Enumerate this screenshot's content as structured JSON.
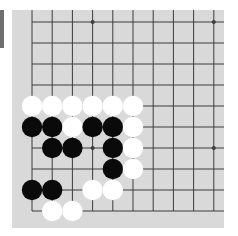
{
  "board": {
    "background": "#d9d9d9",
    "line_color": "#3c3c3c",
    "columns": 10,
    "rows": 10,
    "origin": {
      "x": 20,
      "y": 12
    },
    "col_spacing": 20.2,
    "row_spacing": 21,
    "edges": {
      "left": true,
      "bottom": true,
      "top": false,
      "right": false
    },
    "star_points": [
      [
        3,
        0
      ],
      [
        9,
        0
      ],
      [
        3,
        6
      ],
      [
        9,
        6
      ]
    ],
    "stones": [
      {
        "col": 0,
        "row": 4,
        "color": "white"
      },
      {
        "col": 1,
        "row": 4,
        "color": "white"
      },
      {
        "col": 2,
        "row": 4,
        "color": "white"
      },
      {
        "col": 3,
        "row": 4,
        "color": "white"
      },
      {
        "col": 4,
        "row": 4,
        "color": "white"
      },
      {
        "col": 5,
        "row": 4,
        "color": "white"
      },
      {
        "col": 0,
        "row": 5,
        "color": "black"
      },
      {
        "col": 1,
        "row": 5,
        "color": "black"
      },
      {
        "col": 2,
        "row": 5,
        "color": "white"
      },
      {
        "col": 3,
        "row": 5,
        "color": "black"
      },
      {
        "col": 4,
        "row": 5,
        "color": "black"
      },
      {
        "col": 5,
        "row": 5,
        "color": "white"
      },
      {
        "col": 1,
        "row": 6,
        "color": "black"
      },
      {
        "col": 2,
        "row": 6,
        "color": "black"
      },
      {
        "col": 4,
        "row": 6,
        "color": "black"
      },
      {
        "col": 5,
        "row": 6,
        "color": "white"
      },
      {
        "col": 4,
        "row": 7,
        "color": "black"
      },
      {
        "col": 5,
        "row": 7,
        "color": "white"
      },
      {
        "col": 0,
        "row": 8,
        "color": "black"
      },
      {
        "col": 1,
        "row": 8,
        "color": "black"
      },
      {
        "col": 3,
        "row": 8,
        "color": "white"
      },
      {
        "col": 4,
        "row": 8,
        "color": "white"
      },
      {
        "col": 1,
        "row": 9,
        "color": "white"
      },
      {
        "col": 2,
        "row": 9,
        "color": "white"
      }
    ],
    "stone_colors": {
      "black": "#0a0a0a",
      "white": "#ffffff"
    },
    "stone_radius": 10.2
  }
}
